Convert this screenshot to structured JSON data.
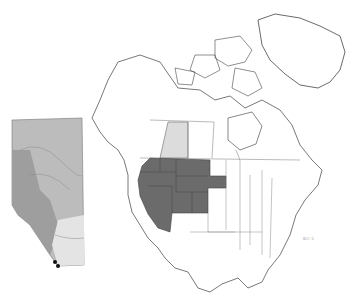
{
  "figure": {
    "type": "species distribution map",
    "inset": {
      "region": "Alberta",
      "occurrence_marker_color": "#111111",
      "shading": "natural regions (grayscale)"
    },
    "main_map": {
      "region": "North America",
      "highlighted_color": "#6b6b6b",
      "alberta_highlight_color": "#dcdcdc",
      "highlighted_regions": [
        "British Columbia (southern tip)",
        "Washington",
        "Oregon",
        "California",
        "Idaho",
        "Nevada",
        "Montana",
        "Wyoming",
        "Utah",
        "Arizona",
        "Colorado",
        "North Dakota",
        "South Dakota"
      ]
    },
    "corner_label": "ID#: 5"
  },
  "colors": {
    "background": "#ffffff",
    "outline": "#555555",
    "range": "#6b6b6b",
    "alberta": "#dcdcdc"
  }
}
